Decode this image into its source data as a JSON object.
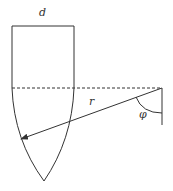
{
  "labels": {
    "d": "d",
    "r": "r",
    "phi": "φ"
  },
  "colors": {
    "stroke": "#333333",
    "background": "#ffffff"
  }
}
